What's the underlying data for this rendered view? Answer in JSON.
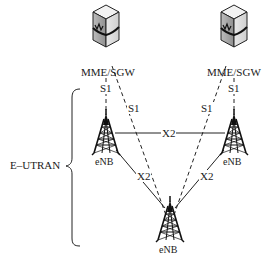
{
  "diagram": {
    "region_label": "E–UTRAN",
    "core_nodes": [
      {
        "id": "mme1",
        "label": "MME/SGW",
        "icon": "server-icon"
      },
      {
        "id": "mme2",
        "label": "MME/SGW",
        "icon": "server-icon"
      }
    ],
    "ran_nodes": [
      {
        "id": "enb_left",
        "label": "eNB",
        "icon": "cell-tower-icon"
      },
      {
        "id": "enb_right",
        "label": "eNB",
        "icon": "cell-tower-icon"
      },
      {
        "id": "enb_bottom",
        "label": "eNB",
        "icon": "cell-tower-icon"
      }
    ],
    "links": [
      {
        "from": "mme1",
        "to": "enb_left",
        "label": "S1",
        "style": "dashed"
      },
      {
        "from": "mme1",
        "to": "enb_bottom",
        "label": "S1",
        "style": "dashed"
      },
      {
        "from": "mme2",
        "to": "enb_bottom",
        "label": "S1",
        "style": "dashed"
      },
      {
        "from": "mme2",
        "to": "enb_right",
        "label": "S1",
        "style": "dashed"
      },
      {
        "from": "enb_left",
        "to": "enb_right",
        "label": "X2",
        "style": "solid"
      },
      {
        "from": "enb_left",
        "to": "enb_bottom",
        "label": "X2",
        "style": "solid"
      },
      {
        "from": "enb_right",
        "to": "enb_bottom",
        "label": "X2",
        "style": "solid"
      }
    ]
  }
}
